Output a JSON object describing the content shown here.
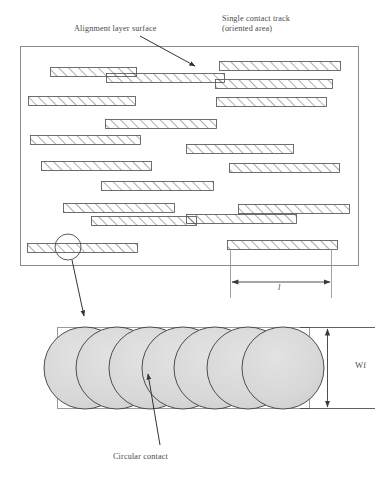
{
  "figure": {
    "title_labels": {
      "alignment_layer_surface": "Alignment layer surface",
      "single_contact_track_line1": "Single contact track",
      "single_contact_track_line2": "(oriented area)",
      "circular_contact": "Circular contact"
    },
    "dimensions": {
      "length_label": "l",
      "width_label": "Wf"
    },
    "colors": {
      "outline": "#555555",
      "frame": "#808080",
      "hatch": "#4a4a4a",
      "contact_fill": "#d9d9d9",
      "contact_stroke": "#4d4d4d",
      "text": "#4a4a4a",
      "arrow": "#333333"
    },
    "alignment_frame": {
      "x": 20,
      "y": 46,
      "width": 338,
      "height": 219
    },
    "contact_tracks": [
      {
        "x": 50,
        "y": 67,
        "width": 86,
        "height": 9
      },
      {
        "x": 219,
        "y": 61,
        "width": 121,
        "height": 9
      },
      {
        "x": 106,
        "y": 73,
        "width": 118,
        "height": 9
      },
      {
        "x": 28,
        "y": 96,
        "width": 107,
        "height": 9
      },
      {
        "x": 215,
        "y": 79,
        "width": 117,
        "height": 9
      },
      {
        "x": 216,
        "y": 97,
        "width": 110,
        "height": 9
      },
      {
        "x": 105,
        "y": 119,
        "width": 111,
        "height": 9
      },
      {
        "x": 30,
        "y": 135,
        "width": 110,
        "height": 9
      },
      {
        "x": 186,
        "y": 144,
        "width": 107,
        "height": 9
      },
      {
        "x": 41,
        "y": 161,
        "width": 110,
        "height": 9
      },
      {
        "x": 229,
        "y": 163,
        "width": 110,
        "height": 9
      },
      {
        "x": 101,
        "y": 181,
        "width": 112,
        "height": 9
      },
      {
        "x": 63,
        "y": 203,
        "width": 111,
        "height": 9
      },
      {
        "x": 238,
        "y": 204,
        "width": 111,
        "height": 9
      },
      {
        "x": 91,
        "y": 216,
        "width": 105,
        "height": 9
      },
      {
        "x": 186,
        "y": 214,
        "width": 110,
        "height": 9
      },
      {
        "x": 27,
        "y": 243,
        "width": 110,
        "height": 9
      },
      {
        "x": 227,
        "y": 240,
        "width": 110,
        "height": 9
      }
    ],
    "detail_circle": {
      "cx": 68,
      "cy": 247,
      "r": 13
    },
    "detail_arrow": {
      "x1": 72,
      "y1": 260,
      "x2": 85,
      "y2": 316
    },
    "alignment_arrow": {
      "x1": 140,
      "y1": 36,
      "x2": 196,
      "y2": 67
    },
    "circular_contact_arrow": {
      "x1": 160,
      "y1": 446,
      "x2": 147,
      "y2": 373
    },
    "contact_strip": {
      "x": 57,
      "y": 327,
      "width": 252,
      "height": 81
    },
    "contacts": [
      {
        "cx": 85,
        "cy": 368,
        "r": 41
      },
      {
        "cx": 117,
        "cy": 368,
        "r": 41
      },
      {
        "cx": 150,
        "cy": 368,
        "r": 41
      },
      {
        "cx": 183,
        "cy": 368,
        "r": 41
      },
      {
        "cx": 215,
        "cy": 368,
        "r": 41
      },
      {
        "cx": 248,
        "cy": 368,
        "r": 41
      },
      {
        "cx": 283,
        "cy": 368,
        "r": 41
      }
    ],
    "dim_length_line": {
      "x1": 232,
      "y1": 287,
      "x2": 330,
      "y2": 287
    },
    "dim_width_line": {
      "x1": 327,
      "y1": 327,
      "x2": 327,
      "y2": 408
    }
  }
}
